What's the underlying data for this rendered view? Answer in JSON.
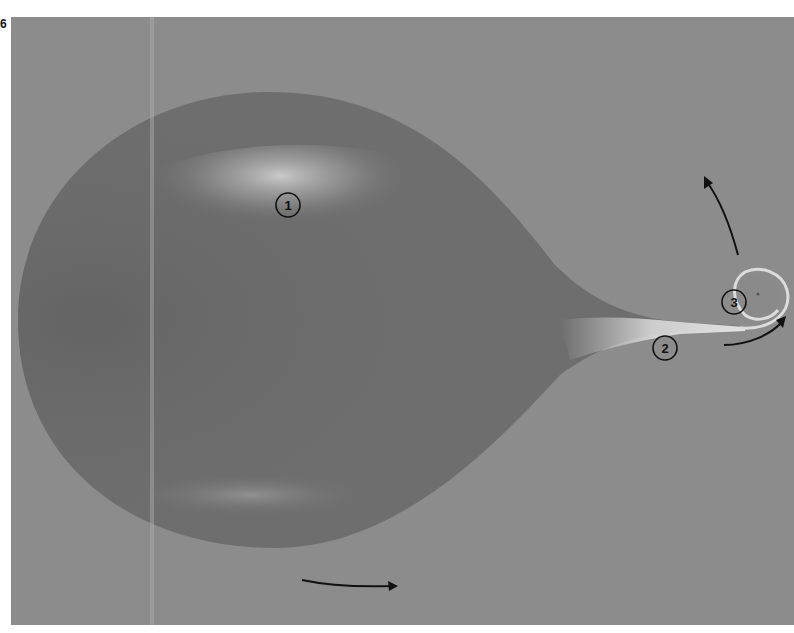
{
  "figure": {
    "number": "6",
    "background_color": "#8c8c8c",
    "drop_color": "#6e6e6e",
    "annotation_color": "#111111"
  },
  "labels": [
    {
      "id": "1",
      "text": "1",
      "x": 288,
      "y": 205
    },
    {
      "id": "2",
      "text": "2",
      "x": 665,
      "y": 348
    },
    {
      "id": "3",
      "text": "3",
      "x": 734,
      "y": 302
    }
  ],
  "arrows": [
    {
      "name": "bottom-arrow",
      "direction": "right"
    },
    {
      "name": "upper-arrow",
      "direction": "up-left"
    },
    {
      "name": "curl-arrow",
      "direction": "up-right"
    }
  ]
}
